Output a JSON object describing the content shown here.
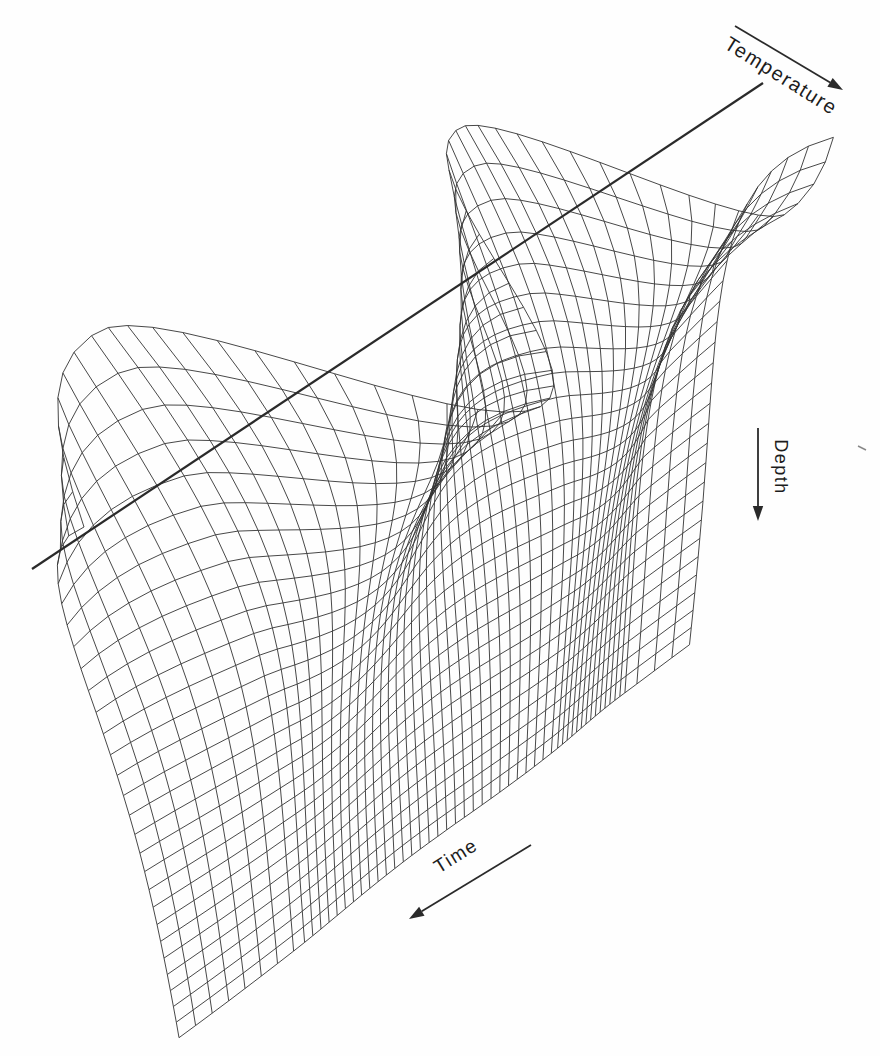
{
  "figure": {
    "width": 880,
    "height": 1056,
    "background": "#fefefe",
    "line_color": "#333333",
    "axis_line_color": "#2a2a2a",
    "label_color": "#1c1c1c"
  },
  "chart_data": {
    "type": "surface",
    "projection": "3d-wireframe-oblique-perspective",
    "title": "",
    "model": {
      "equation": "T(z,t) = T0 + dT * exp(-z/d) * cos(w*t - z/d)",
      "periods_visible": 1.86,
      "crests_visible": 2,
      "troughs_visible": 2,
      "amplitude_decay": "exponential with depth",
      "phase_shift": "crest lines drift toward later time with increasing depth"
    },
    "axes": {
      "temperature": {
        "label": "Temperature",
        "direction": "arrow points down-right (increasing temperature)"
      },
      "depth": {
        "label": "Depth",
        "direction": "arrow points downward (increasing depth)"
      },
      "time": {
        "label": "Time",
        "direction": "arrow points down-left (increasing time)"
      }
    },
    "mesh": {
      "time_lines": 57,
      "depth_lines": 29,
      "grid": "curvilinear quadrilateral mesh"
    },
    "axis_line": {
      "x1": 32,
      "y1": 569,
      "x2": 763,
      "y2": 83,
      "width": 2.2
    },
    "arrows": [
      {
        "name": "temperature-axis-arrow",
        "x1": 735,
        "y1": 26,
        "x2": 843,
        "y2": 90,
        "width": 1.8
      },
      {
        "name": "depth-axis-arrow",
        "x1": 758,
        "y1": 428,
        "x2": 758,
        "y2": 521,
        "width": 1.8
      },
      {
        "name": "time-axis-arrow",
        "x1": 531,
        "y1": 845,
        "x2": 409,
        "y2": 919,
        "width": 1.8
      }
    ],
    "labels": {
      "temperature": {
        "text": "Temperature",
        "x": 781,
        "y": 76,
        "rot": 32,
        "size": 20
      },
      "depth": {
        "text": "Depth",
        "x": 780,
        "y": 467,
        "rot": 90,
        "size": 18
      },
      "time": {
        "text": "Time",
        "x": 456,
        "y": 856,
        "rot": -32,
        "size": 19
      }
    },
    "artifact_tick": {
      "x1": 858,
      "y1": 446,
      "x2": 866,
      "y2": 450
    },
    "render": {
      "quad": [
        [
          90,
          531
        ],
        [
          757,
          87
        ],
        [
          178,
          1037
        ],
        [
          690,
          645
        ]
      ],
      "uT": [
        0.835,
        0.55
      ],
      "amp0": 191,
      "ampSlope": 0.35,
      "decay": 4.3,
      "phaseLag": 3.6,
      "phaseKnots": [
        [
          0,
          4.75
        ],
        [
          0.233,
          6.2832
        ],
        [
          0.733,
          12.5664
        ],
        [
          0.88,
          15.708
        ],
        [
          1.0,
          16.45
        ]
      ],
      "depthWarp": 1.18,
      "nT": 56,
      "nZ": 28,
      "strokeWidth": 0.9
    }
  }
}
